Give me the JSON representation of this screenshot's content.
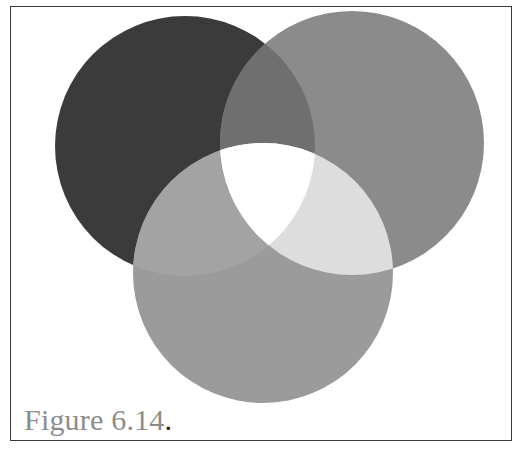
{
  "figure": {
    "caption_text": "Figure 6.14",
    "caption_period": "."
  },
  "venn": {
    "circles": [
      {
        "id": "left",
        "cx": 185,
        "cy": 146,
        "r": 130,
        "color": "#3b3b3b"
      },
      {
        "id": "right",
        "cx": 352,
        "cy": 143,
        "r": 132,
        "color": "#8b8b8b"
      },
      {
        "id": "bottom",
        "cx": 263,
        "cy": 273,
        "r": 130,
        "color": "#9b9b9b"
      }
    ],
    "overlaps": {
      "left_right": "#6f6f6f",
      "left_bottom": "#a3a3a3",
      "right_bottom": "#dddddd",
      "all_three": "#ffffff"
    }
  }
}
